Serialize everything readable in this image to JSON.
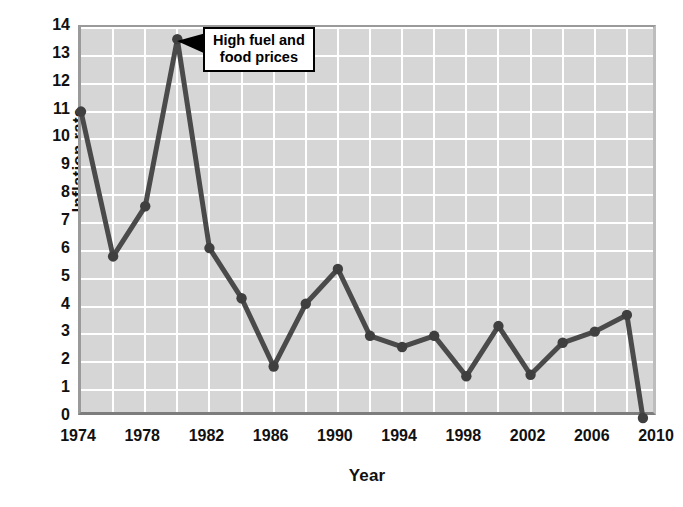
{
  "chart_data": {
    "type": "line",
    "title": "",
    "xlabel": "Year",
    "ylabel": "Inflation rate",
    "xlim": [
      1974,
      2010
    ],
    "ylim": [
      0,
      14
    ],
    "xticks": [
      "1974",
      "1978",
      "1982",
      "1986",
      "1990",
      "1994",
      "1998",
      "2002",
      "2006",
      "2010"
    ],
    "yticks": [
      "0",
      "1",
      "2",
      "3",
      "4",
      "5",
      "6",
      "7",
      "8",
      "9",
      "10",
      "11",
      "12",
      "13",
      "14"
    ],
    "grid": true,
    "legend": "none",
    "x": [
      1974,
      1976,
      1978,
      1980,
      1982,
      1984,
      1986,
      1988,
      1990,
      1992,
      1994,
      1996,
      1998,
      2000,
      2002,
      2004,
      2006,
      2008,
      2009
    ],
    "values": [
      11.0,
      5.8,
      7.6,
      13.6,
      6.1,
      4.3,
      1.85,
      4.1,
      5.35,
      2.95,
      2.55,
      2.95,
      1.5,
      3.3,
      1.55,
      2.7,
      3.1,
      3.7,
      0.0
    ],
    "series": [
      {
        "name": "Inflation rate",
        "values": [
          11.0,
          5.8,
          7.6,
          13.6,
          6.1,
          4.3,
          1.85,
          4.1,
          5.35,
          2.95,
          2.55,
          2.95,
          1.5,
          3.3,
          1.55,
          2.7,
          3.1,
          3.7,
          0.0
        ]
      }
    ],
    "annotations": [
      {
        "text": "High fuel and\nfood prices",
        "points_to_x": 1980,
        "points_to_y": 13.6
      }
    ],
    "colors": {
      "line": "#4a4a4a",
      "marker": "#3f3f3f",
      "plot_background": "#d6d6d6",
      "gridline": "#ffffff",
      "frame": "#9a9a9a",
      "text": "#111111",
      "annotation_border": "#000000",
      "annotation_background": "#ffffff"
    }
  },
  "annotation": {
    "text": "High fuel and\nfood prices"
  }
}
